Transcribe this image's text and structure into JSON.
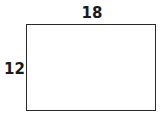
{
  "diagram": {
    "shape": "rectangle",
    "width_label": "18",
    "height_label": "12"
  }
}
